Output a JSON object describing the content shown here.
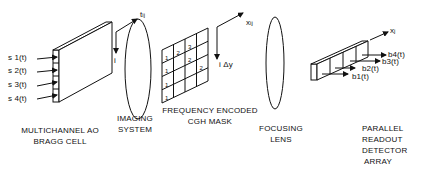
{
  "diagram": {
    "components": [
      {
        "id": "bragg-cell",
        "caption": [
          "MULTICHANNEL AO",
          "BRAGG CELL"
        ],
        "inputs": [
          "s 1(t)",
          "s 2(t)",
          "s 3(t)",
          "s 4(t)"
        ]
      },
      {
        "id": "imaging-system",
        "caption": [
          "IMAGING",
          "SYSTEM"
        ],
        "axis_labels": {
          "horizontal": "t",
          "horizontal_sub": "ij",
          "vertical": "i"
        }
      },
      {
        "id": "cgh-mask",
        "caption": [
          "FREQUENCY ENCODED",
          "CGH MASK"
        ],
        "grid": [
          [
            "1",
            "2",
            "3",
            ""
          ],
          [
            "1",
            "",
            "2",
            ""
          ],
          [
            "1",
            "",
            "",
            "2"
          ],
          [
            "1",
            "",
            "",
            ""
          ]
        ],
        "axis_labels": {
          "horizontal": "x",
          "horizontal_sub": "ij",
          "vertical": "i Δy"
        }
      },
      {
        "id": "focusing-lens",
        "caption": [
          "FOCUSING",
          "LENS"
        ]
      },
      {
        "id": "detector-array",
        "caption": [
          "PARALLEL",
          "READOUT",
          "DETECTOR",
          "ARRAY"
        ],
        "outputs": [
          "b4(t)",
          "b3(t)",
          "b2(t)",
          "b1(t)"
        ],
        "axis_labels": {
          "horizontal": "x",
          "horizontal_sub": "j"
        }
      }
    ]
  }
}
